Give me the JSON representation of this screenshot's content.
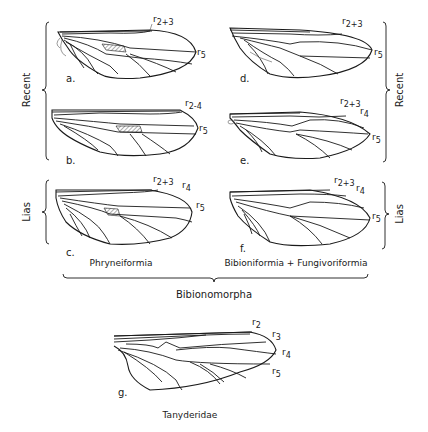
{
  "figure": {
    "side_labels": {
      "left_recent": "Recent",
      "left_lias": "Lias",
      "right_recent": "Recent",
      "right_lias": "Lias"
    },
    "group_labels": {
      "left_column": "Phryneiformia",
      "right_column": "Bibioniformia + Fungivoriformia",
      "combined": "Bibionomorpha",
      "bottom": "Tanyderidae"
    },
    "wings": [
      {
        "id": "a",
        "label": "a.",
        "veins": [
          {
            "name": "r",
            "sub": "2+3"
          },
          {
            "name": "r",
            "sub": "5"
          }
        ]
      },
      {
        "id": "b",
        "label": "b.",
        "veins": [
          {
            "name": "r",
            "sub": "2-4"
          },
          {
            "name": "r",
            "sub": "5"
          }
        ]
      },
      {
        "id": "c",
        "label": "c.",
        "veins": [
          {
            "name": "r",
            "sub": "2+3"
          },
          {
            "name": "r",
            "sub": "4"
          },
          {
            "name": "r",
            "sub": "5"
          }
        ]
      },
      {
        "id": "d",
        "label": "d.",
        "veins": [
          {
            "name": "r",
            "sub": "2+3"
          },
          {
            "name": "r",
            "sub": "5"
          }
        ]
      },
      {
        "id": "e",
        "label": "e.",
        "veins": [
          {
            "name": "r",
            "sub": "2+3"
          },
          {
            "name": "r",
            "sub": "4"
          },
          {
            "name": "r",
            "sub": "5"
          }
        ]
      },
      {
        "id": "f",
        "label": "f.",
        "veins": [
          {
            "name": "r",
            "sub": "2+3"
          },
          {
            "name": "r",
            "sub": "4"
          },
          {
            "name": "r",
            "sub": "5"
          }
        ]
      },
      {
        "id": "g",
        "label": "g.",
        "veins": [
          {
            "name": "r",
            "sub": "2"
          },
          {
            "name": "r",
            "sub": "3"
          },
          {
            "name": "r",
            "sub": "4"
          },
          {
            "name": "r",
            "sub": "5"
          }
        ]
      }
    ]
  }
}
